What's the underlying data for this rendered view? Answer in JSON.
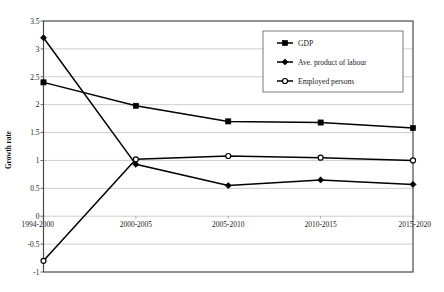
{
  "chart_data": {
    "type": "line",
    "title": "",
    "xlabel": "",
    "ylabel": "Growth rate",
    "categories": [
      "1994-2000",
      "2000-2005",
      "2005-2010",
      "2010-2015",
      "2015-2020"
    ],
    "ylim": [
      -1,
      3.5
    ],
    "ytick_step": 0.5,
    "ytick_labels": [
      "3.5",
      "3",
      "2.5",
      "2",
      "1.5",
      "1",
      "0.5",
      "0",
      "-0.5",
      "-1"
    ],
    "ytick_values": [
      3.5,
      3,
      2.5,
      2,
      1.5,
      1,
      0.5,
      0,
      -0.5,
      -1
    ],
    "grid": true,
    "legend_position": "upper-right-inside",
    "series": [
      {
        "name": "GDP",
        "marker": "filled-square",
        "color": "#000000",
        "values": [
          2.4,
          1.98,
          1.7,
          1.68,
          1.58
        ]
      },
      {
        "name": "Ave. product of labour",
        "marker": "filled-diamond",
        "color": "#000000",
        "values": [
          3.2,
          0.93,
          0.55,
          0.65,
          0.57
        ]
      },
      {
        "name": "Employed persons",
        "marker": "open-circle",
        "color": "#000000",
        "values": [
          -0.8,
          1.02,
          1.08,
          1.05,
          1.0
        ]
      }
    ]
  },
  "axis": {
    "y_title": "Growth rate"
  },
  "legend": {
    "items": [
      {
        "label": "GDP",
        "marker": "square-marker-icon"
      },
      {
        "label": "Ave. product of labour",
        "marker": "diamond-marker-icon"
      },
      {
        "label": "Employed persons",
        "marker": "circle-marker-icon"
      }
    ]
  }
}
